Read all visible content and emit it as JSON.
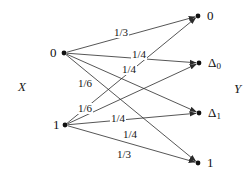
{
  "figure": {
    "kind": "bipartite-channel-diagram",
    "input_axis_label": "X",
    "output_axis_label": "Y",
    "edge_color": "#2b2b2b",
    "node_color": "#111111",
    "background": "#ffffff"
  },
  "input_nodes": [
    {
      "id": "x0",
      "label": "0",
      "x": 64,
      "y": 53
    },
    {
      "id": "x1",
      "label": "1",
      "x": 65,
      "y": 125
    }
  ],
  "output_nodes": [
    {
      "id": "y0",
      "label": "0",
      "sub": "",
      "x": 198,
      "y": 16
    },
    {
      "id": "yd0",
      "label": "Δ",
      "sub": "0",
      "x": 199,
      "y": 63
    },
    {
      "id": "yd1",
      "label": "Δ",
      "sub": "1",
      "x": 199,
      "y": 113
    },
    {
      "id": "y1",
      "label": "1",
      "sub": "",
      "x": 198,
      "y": 163
    }
  ],
  "edges": [
    {
      "from": "x0",
      "to": "y0",
      "weight": "1/3",
      "lx": 113,
      "ly": 27
    },
    {
      "from": "x0",
      "to": "yd0",
      "weight": "1/4",
      "lx": 131,
      "ly": 49
    },
    {
      "from": "x0",
      "to": "yd1",
      "weight": "1/4",
      "lx": 121,
      "ly": 64
    },
    {
      "from": "x0",
      "to": "y1",
      "weight": "1/6",
      "lx": 77,
      "ly": 78
    },
    {
      "from": "x1",
      "to": "y0",
      "weight": "1/6",
      "lx": 77,
      "ly": 103
    },
    {
      "from": "x1",
      "to": "yd0",
      "weight": "1/4",
      "lx": 110,
      "ly": 113
    },
    {
      "from": "x1",
      "to": "yd1",
      "weight": "1/4",
      "lx": 122,
      "ly": 129
    },
    {
      "from": "x1",
      "to": "y1",
      "weight": "1/3",
      "lx": 116,
      "ly": 149
    }
  ],
  "edge_labels_order": [
    "1/3",
    "1/4",
    "1/4",
    "1/6",
    "1/6",
    "1/4",
    "1/4",
    "1/3"
  ]
}
